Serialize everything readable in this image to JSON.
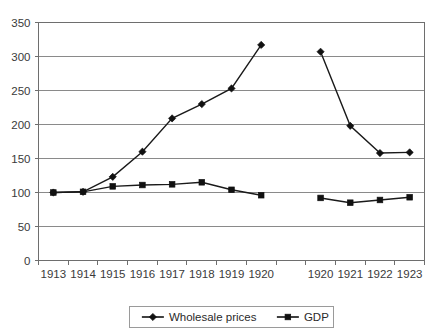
{
  "chart_data": {
    "type": "line",
    "title": "",
    "subtitle": "",
    "xlabel": "",
    "ylabel": "",
    "ylim": [
      0,
      350
    ],
    "ytick_step": 50,
    "yticks": [
      "0",
      "50",
      "100",
      "150",
      "200",
      "250",
      "300",
      "350"
    ],
    "grid": true,
    "axis_break": true,
    "legend_position": "bottom-center",
    "categories": [
      "1913",
      "1914",
      "1915",
      "1916",
      "1917",
      "1918",
      "1919",
      "1920",
      "",
      "1920",
      "1921",
      "1922",
      "1923"
    ],
    "segments": [
      {
        "name": "period-1",
        "categories": [
          "1913",
          "1914",
          "1915",
          "1916",
          "1917",
          "1918",
          "1919",
          "1920"
        ]
      },
      {
        "name": "period-2",
        "categories": [
          "1920",
          "1921",
          "1922",
          "1923"
        ]
      }
    ],
    "series": [
      {
        "name": "Wholesale prices",
        "marker": "diamond",
        "color": "#111111",
        "values_segment_1": [
          100,
          101,
          123,
          160,
          209,
          230,
          253,
          317
        ],
        "values_segment_2": [
          307,
          198,
          158,
          159
        ]
      },
      {
        "name": "GDP",
        "marker": "square",
        "color": "#111111",
        "values_segment_1": [
          100,
          101,
          109,
          111,
          112,
          115,
          104,
          96
        ],
        "values_segment_2": [
          92,
          85,
          89,
          93
        ]
      }
    ]
  },
  "legend": {
    "items": [
      {
        "label": "Wholesale prices",
        "marker": "diamond"
      },
      {
        "label": "GDP",
        "marker": "square"
      }
    ]
  }
}
